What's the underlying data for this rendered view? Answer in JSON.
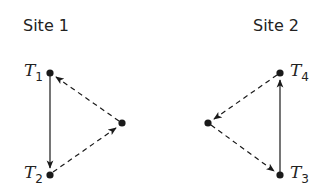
{
  "sites": [
    {
      "label": "Site 1"
    },
    {
      "label": "Site 2"
    }
  ],
  "nodes": {
    "T1": {
      "var": "T",
      "sub": "1"
    },
    "T2": {
      "var": "T",
      "sub": "2"
    },
    "T3": {
      "var": "T",
      "sub": "3"
    },
    "T4": {
      "var": "T",
      "sub": "4"
    }
  },
  "edges": [
    {
      "from": "T1",
      "to": "T2",
      "style": "solid"
    },
    {
      "from": "site1-extra",
      "to": "T1",
      "style": "dashed"
    },
    {
      "from": "T2",
      "to": "site1-extra",
      "style": "dashed"
    },
    {
      "from": "T3",
      "to": "T4",
      "style": "solid"
    },
    {
      "from": "T4",
      "to": "site2-extra",
      "style": "dashed"
    },
    {
      "from": "site2-extra",
      "to": "T3",
      "style": "dashed"
    }
  ],
  "colors": {
    "ink": "#1a1a1a",
    "background": "#ffffff"
  }
}
